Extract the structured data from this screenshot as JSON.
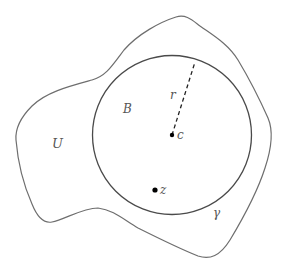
{
  "diagram": {
    "labels": {
      "region": "U",
      "ball": "B",
      "radius": "r",
      "center": "c",
      "point": "z",
      "curve": "γ"
    },
    "colors": {
      "outline": "#6e6e6e",
      "circle": "#4a4a4a",
      "point": "#000000",
      "label": "#555555"
    }
  }
}
